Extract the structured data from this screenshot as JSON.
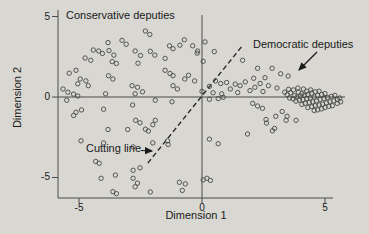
{
  "figure": {
    "background_color": "#d8d7d2",
    "axis_color": "#4a4a4a",
    "point_color": "#474747",
    "text_color": "#1a1a1a"
  },
  "labels": {
    "conservative_annotation": "Conservative deputies",
    "democratic_annotation": "Democratic deputies",
    "cutting_line_annotation": "Cutting line",
    "xlabel": "Dimension 1",
    "ylabel": "Dimension 2"
  },
  "ticks": {
    "y": [
      "5",
      "0",
      "-5"
    ],
    "x": [
      "-5",
      "0",
      "5"
    ]
  },
  "chart_data": {
    "type": "scatter",
    "title": "",
    "xlabel": "Dimension 1",
    "ylabel": "Dimension 2",
    "xlim": [
      -6,
      6
    ],
    "ylim": [
      -6.5,
      5.5
    ],
    "x_ticks": [
      -5,
      0,
      5
    ],
    "y_ticks": [
      5,
      0,
      -5
    ],
    "grid": false,
    "marker": "open-circle",
    "reference_lines": {
      "horizontal_y": 0,
      "vertical_x": 0
    },
    "cutting_line": {
      "style": "dashed",
      "from": [
        -2.2,
        -4.1
      ],
      "to": [
        1.65,
        3.2
      ]
    },
    "annotations": [
      {
        "text": "Conservative deputies",
        "position": "top-left",
        "arrow": false
      },
      {
        "text": "Democratic deputies",
        "position": "top-right",
        "arrow": true,
        "arrow_points_to": "dense cluster near (4, 0)"
      },
      {
        "text": "Cutting line",
        "position": "bottom-left",
        "arrow": true,
        "arrow_points_to": "dashed line"
      }
    ],
    "series": [
      {
        "name": "Conservative deputies",
        "points": [
          [
            -2.3,
            4.1
          ],
          [
            -2.12,
            3.88
          ],
          [
            -3.82,
            3.38
          ],
          [
            -3.25,
            3.52
          ],
          [
            -3.08,
            3.28
          ],
          [
            -0.72,
            3.55
          ],
          [
            -0.9,
            3.22
          ],
          [
            -1.32,
            3.18
          ],
          [
            -1.18,
            3.0
          ],
          [
            -4.42,
            2.92
          ],
          [
            -4.2,
            2.86
          ],
          [
            -4.05,
            2.7
          ],
          [
            -3.78,
            2.88
          ],
          [
            -3.58,
            2.6
          ],
          [
            -2.72,
            2.86
          ],
          [
            -2.5,
            2.58
          ],
          [
            -2.1,
            2.84
          ],
          [
            -1.92,
            2.6
          ],
          [
            -4.75,
            2.42
          ],
          [
            -4.52,
            2.28
          ],
          [
            -3.65,
            2.2
          ],
          [
            -3.48,
            2.08
          ],
          [
            -2.6,
            2.1
          ],
          [
            -1.5,
            2.4
          ],
          [
            -0.38,
            3.18
          ],
          [
            -0.18,
            2.86
          ],
          [
            0.05,
            2.22
          ],
          [
            -5.12,
            1.66
          ],
          [
            -5.4,
            1.48
          ],
          [
            -4.95,
            1.12
          ],
          [
            -4.72,
            1.0
          ],
          [
            -5.05,
            0.82
          ],
          [
            -4.62,
            0.7
          ],
          [
            -3.8,
            1.32
          ],
          [
            -3.62,
            1.12
          ],
          [
            -2.84,
            0.7
          ],
          [
            -2.62,
            0.6
          ],
          [
            -1.5,
            1.66
          ],
          [
            -1.3,
            1.46
          ],
          [
            -1.18,
            1.32
          ],
          [
            -0.7,
            1.12
          ],
          [
            -0.55,
            1.35
          ],
          [
            -0.3,
            1.0
          ],
          [
            -1.18,
            0.7
          ],
          [
            -1.0,
            0.5
          ],
          [
            -5.45,
            0.3
          ],
          [
            -5.22,
            0.18
          ],
          [
            -5.05,
            0.06
          ],
          [
            -5.65,
            0.5
          ],
          [
            -3.92,
            0.2
          ],
          [
            -2.72,
            0.2
          ],
          [
            -2.42,
            0.32
          ],
          [
            0.0,
            0.35
          ],
          [
            0.12,
            3.42
          ],
          [
            0.5,
            2.82
          ],
          [
            -0.2,
            2.72
          ],
          [
            -5.5,
            -0.2
          ],
          [
            -5.12,
            -0.95
          ],
          [
            -4.9,
            -0.8
          ],
          [
            -5.22,
            -1.15
          ],
          [
            -4.0,
            -0.76
          ],
          [
            -1.9,
            -0.2
          ],
          [
            -1.22,
            -0.3
          ],
          [
            -2.82,
            -0.5
          ],
          [
            -2.7,
            -1.45
          ],
          [
            -2.52,
            -1.6
          ],
          [
            -1.9,
            -1.45
          ],
          [
            -2.0,
            -1.72
          ],
          [
            -2.3,
            -2.0
          ],
          [
            -2.18,
            -2.12
          ],
          [
            -3.82,
            -2.02
          ],
          [
            -3.02,
            -2.02
          ],
          [
            -4.92,
            -2.72
          ],
          [
            -4.0,
            -2.85
          ],
          [
            -2.8,
            -3.1
          ],
          [
            -1.38,
            -2.95
          ],
          [
            -4.32,
            -4.0
          ],
          [
            -4.18,
            -4.12
          ],
          [
            -2.8,
            -4.55
          ],
          [
            -2.52,
            -4.4
          ],
          [
            -2.0,
            -2.85
          ],
          [
            -1.4,
            -2.72
          ],
          [
            -4.1,
            -5.05
          ],
          [
            -3.52,
            -4.85
          ],
          [
            -2.8,
            -5.05
          ],
          [
            -2.62,
            -5.35
          ],
          [
            -2.72,
            -5.58
          ],
          [
            -3.62,
            -5.88
          ],
          [
            -3.48,
            -6.0
          ],
          [
            -2.1,
            -5.9
          ],
          [
            -0.92,
            -5.3
          ],
          [
            -0.8,
            -5.8
          ],
          [
            -0.68,
            -5.4
          ],
          [
            0.05,
            -5.15
          ]
        ]
      },
      {
        "name": "Democratic deputies",
        "points": [
          [
            1.65,
            2.28
          ],
          [
            2.26,
            1.78
          ],
          [
            2.1,
            1.16
          ],
          [
            2.85,
            1.78
          ],
          [
            3.2,
            1.44
          ],
          [
            3.5,
            1.3
          ],
          [
            2.36,
            0.84
          ],
          [
            2.7,
            0.7
          ],
          [
            3.05,
            0.56
          ],
          [
            0.55,
            1.0
          ],
          [
            0.76,
            0.84
          ],
          [
            1.0,
            0.9
          ],
          [
            1.35,
            0.8
          ],
          [
            1.55,
            0.7
          ],
          [
            1.15,
            0.5
          ],
          [
            1.95,
            0.4
          ],
          [
            0.45,
            0.26
          ],
          [
            0.8,
            0.2
          ],
          [
            2.15,
            0.6
          ],
          [
            2.48,
            0.34
          ],
          [
            1.76,
            0.94
          ],
          [
            2.56,
            1.2
          ],
          [
            0.3,
            0.66
          ],
          [
            1.45,
            0.28
          ],
          [
            0.3,
            -0.14
          ],
          [
            0.66,
            -0.1
          ],
          [
            0.86,
            -0.02
          ],
          [
            2.06,
            -0.4
          ],
          [
            2.46,
            -0.7
          ],
          [
            2.26,
            -0.56
          ],
          [
            3.26,
            -0.9
          ],
          [
            3.46,
            -1.2
          ],
          [
            3.0,
            -1.2
          ],
          [
            2.6,
            -1.4
          ],
          [
            2.95,
            -1.95
          ],
          [
            1.85,
            -2.3
          ],
          [
            0.66,
            -2.9
          ],
          [
            0.3,
            -2.62
          ],
          [
            2.62,
            -1.62
          ],
          [
            2.86,
            -2.1
          ],
          [
            3.42,
            -1.45
          ],
          [
            3.82,
            -1.45
          ],
          [
            0.2,
            -5.05
          ],
          [
            0.34,
            -5.18
          ],
          [
            3.36,
            0.3
          ],
          [
            3.52,
            0.48
          ],
          [
            3.72,
            0.44
          ],
          [
            3.9,
            0.56
          ],
          [
            4.12,
            0.5
          ],
          [
            3.46,
            0.14
          ],
          [
            3.6,
            0.26
          ],
          [
            3.76,
            0.08
          ],
          [
            3.92,
            0.3
          ],
          [
            4.06,
            0.2
          ],
          [
            4.26,
            0.36
          ],
          [
            4.42,
            0.44
          ],
          [
            3.56,
            -0.06
          ],
          [
            3.7,
            -0.12
          ],
          [
            3.86,
            0.0
          ],
          [
            4.0,
            0.06
          ],
          [
            4.16,
            0.1
          ],
          [
            4.3,
            0.16
          ],
          [
            4.46,
            0.24
          ],
          [
            4.6,
            0.32
          ],
          [
            4.76,
            0.36
          ],
          [
            3.82,
            -0.26
          ],
          [
            3.96,
            -0.2
          ],
          [
            4.1,
            -0.16
          ],
          [
            4.26,
            -0.1
          ],
          [
            4.4,
            -0.06
          ],
          [
            4.56,
            0.0
          ],
          [
            4.7,
            0.1
          ],
          [
            4.86,
            0.16
          ],
          [
            5.0,
            0.22
          ],
          [
            4.06,
            -0.46
          ],
          [
            4.2,
            -0.4
          ],
          [
            4.36,
            -0.34
          ],
          [
            4.5,
            -0.3
          ],
          [
            4.66,
            -0.24
          ],
          [
            4.8,
            -0.16
          ],
          [
            4.96,
            -0.1
          ],
          [
            5.1,
            -0.04
          ],
          [
            5.26,
            0.04
          ],
          [
            5.4,
            0.1
          ],
          [
            4.3,
            -0.66
          ],
          [
            4.46,
            -0.6
          ],
          [
            4.6,
            -0.54
          ],
          [
            4.76,
            -0.5
          ],
          [
            4.9,
            -0.44
          ],
          [
            5.06,
            -0.36
          ],
          [
            5.2,
            -0.3
          ],
          [
            5.36,
            -0.24
          ],
          [
            5.5,
            -0.16
          ],
          [
            5.6,
            -0.06
          ],
          [
            4.56,
            -0.84
          ],
          [
            4.7,
            -0.8
          ],
          [
            4.86,
            -0.74
          ],
          [
            5.0,
            -0.66
          ],
          [
            5.16,
            -0.58
          ],
          [
            5.3,
            -0.54
          ],
          [
            5.5,
            -0.4
          ],
          [
            5.64,
            -0.3
          ]
        ]
      }
    ]
  }
}
